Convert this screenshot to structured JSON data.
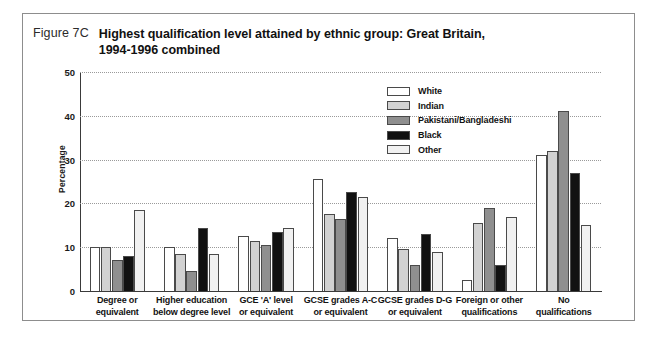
{
  "figure": {
    "number": "Figure 7C",
    "title_line1": "Highest qualification level attained by ethnic group: Great Britain,",
    "title_line2": "1994-1996 combined"
  },
  "legend": {
    "position": "inside-top-right",
    "items": [
      {
        "label": "White",
        "color": "#ffffff"
      },
      {
        "label": "Indian",
        "color": "#d2d2d2"
      },
      {
        "label": "Pakistani/Bangladeshi",
        "color": "#8f8f8f"
      },
      {
        "label": "Black",
        "color": "#111111"
      },
      {
        "label": "Other",
        "color": "#f1f1f1"
      }
    ]
  },
  "axes": {
    "ylabel": "Percentage",
    "yticks": [
      "0",
      "10",
      "20",
      "30",
      "40",
      "50"
    ]
  },
  "chart_data": {
    "type": "bar",
    "title": "Highest qualification level attained by ethnic group: Great Britain, 1994-1996 combined",
    "xlabel": "",
    "ylabel": "Percentage",
    "ylim": [
      0,
      50
    ],
    "ytick_values": [
      0,
      10,
      20,
      30,
      40,
      50
    ],
    "grid": true,
    "legend_position": "inside-top-right",
    "categories": [
      "Degree or equivalent",
      "Higher education below degree level",
      "GCE 'A' level or equivalent",
      "GCSE grades A-C or equivalent",
      "GCSE grades D-G or equivalent",
      "Foreign or other qualifications",
      "No qualifications"
    ],
    "category_lines": [
      [
        "Degree or",
        "equivalent"
      ],
      [
        "Higher education",
        "below degree level"
      ],
      [
        "GCE 'A' level",
        "or equivalent"
      ],
      [
        "GCSE grades A-C",
        "or equivalent"
      ],
      [
        "GCSE grades D-G",
        "or equivalent"
      ],
      [
        "Foreign or other",
        "qualifications"
      ],
      [
        "No",
        "qualifications"
      ]
    ],
    "series": [
      {
        "name": "White",
        "color": "#ffffff",
        "values": [
          10.0,
          10.0,
          12.5,
          25.5,
          12.0,
          2.5,
          31.0
        ]
      },
      {
        "name": "Indian",
        "color": "#d2d2d2",
        "values": [
          10.0,
          8.5,
          11.5,
          17.5,
          9.5,
          15.5,
          32.0
        ]
      },
      {
        "name": "Pakistani/Bangladeshi",
        "color": "#8f8f8f",
        "values": [
          7.0,
          4.5,
          10.5,
          16.5,
          6.0,
          19.0,
          41.0
        ]
      },
      {
        "name": "Black",
        "color": "#111111",
        "values": [
          8.0,
          14.5,
          13.5,
          22.5,
          13.0,
          6.0,
          27.0
        ]
      },
      {
        "name": "Other",
        "color": "#f1f1f1",
        "values": [
          18.5,
          8.5,
          14.5,
          21.5,
          9.0,
          17.0,
          15.0
        ]
      }
    ]
  }
}
